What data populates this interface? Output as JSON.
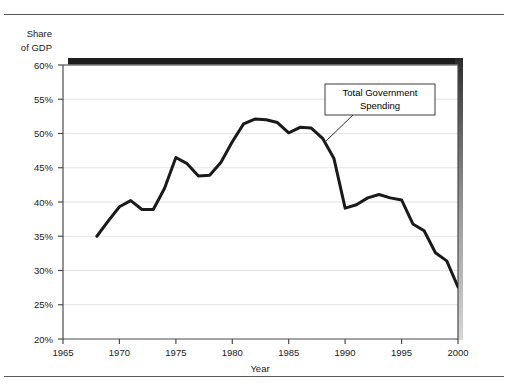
{
  "figure": {
    "has_top_rule": true,
    "has_bottom_rule": true,
    "rule_color": "#59595b",
    "background": "#ffffff"
  },
  "chart_data": {
    "type": "line",
    "title": "",
    "xlabel": "Year",
    "ylabel": "Share of GDP",
    "ylabel_line1": "Share",
    "ylabel_line2": "of GDP",
    "xlim": [
      1965,
      2000
    ],
    "ylim": [
      20,
      60
    ],
    "grid": true,
    "grid_axis": "y",
    "grid_color": "#e3e3e3",
    "legend_position": "none",
    "line_color": "#1a1a1a",
    "line_width": 3,
    "xticks": [
      1965,
      1970,
      1975,
      1980,
      1985,
      1990,
      1995,
      2000
    ],
    "xtick_labels": [
      "1965",
      "1970",
      "1975",
      "1980",
      "1985",
      "1990",
      "1995",
      "2000"
    ],
    "yticks": [
      20,
      25,
      30,
      35,
      40,
      45,
      50,
      55,
      60
    ],
    "ytick_labels": [
      "20%",
      "25%",
      "30%",
      "35%",
      "40%",
      "45%",
      "50%",
      "55%",
      "60%"
    ],
    "series": [
      {
        "name": "Total Government Spending",
        "x": [
          1968,
          1969,
          1970,
          1971,
          1972,
          1973,
          1974,
          1975,
          1976,
          1977,
          1978,
          1979,
          1980,
          1981,
          1982,
          1983,
          1984,
          1985,
          1986,
          1987,
          1988,
          1989,
          1990,
          1991,
          1992,
          1993,
          1994,
          1995,
          1996,
          1997,
          1998,
          1999,
          2000
        ],
        "values": [
          35.0,
          37.2,
          39.3,
          40.2,
          38.9,
          38.9,
          42.0,
          46.5,
          45.6,
          43.8,
          43.9,
          45.8,
          48.8,
          51.4,
          52.1,
          52.0,
          51.6,
          50.1,
          50.9,
          50.8,
          49.3,
          46.4,
          39.1,
          39.6,
          40.6,
          41.1,
          40.6,
          40.3,
          36.8,
          35.8,
          32.6,
          31.4,
          27.6
        ]
      }
    ],
    "annotations": [
      {
        "label_line1": "Total Government",
        "label_line2": "Spending",
        "boxed": true,
        "points_to_x": 1988,
        "points_to_y": 49
      }
    ]
  }
}
